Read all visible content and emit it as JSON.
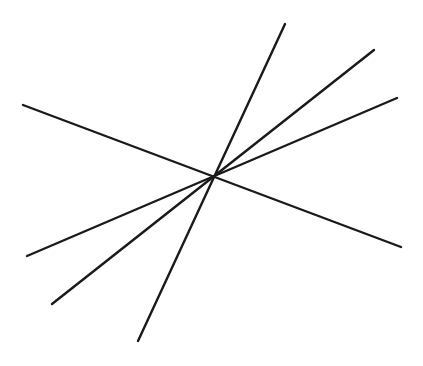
{
  "diagram": {
    "background": "#ffffff",
    "stroke_color": "#1a1a1a",
    "intersection_point": {
      "x": 215,
      "y": 176
    },
    "lines": [
      {
        "id": "line-1",
        "x1": 23,
        "y1": 105,
        "x2": 401,
        "y2": 247
      },
      {
        "id": "line-2",
        "x1": 285,
        "y1": 24,
        "x2": 138,
        "y2": 341
      },
      {
        "id": "line-3",
        "x1": 374,
        "y1": 50,
        "x2": 52,
        "y2": 304
      },
      {
        "id": "line-4",
        "x1": 397,
        "y1": 98,
        "x2": 27,
        "y2": 256
      }
    ]
  }
}
